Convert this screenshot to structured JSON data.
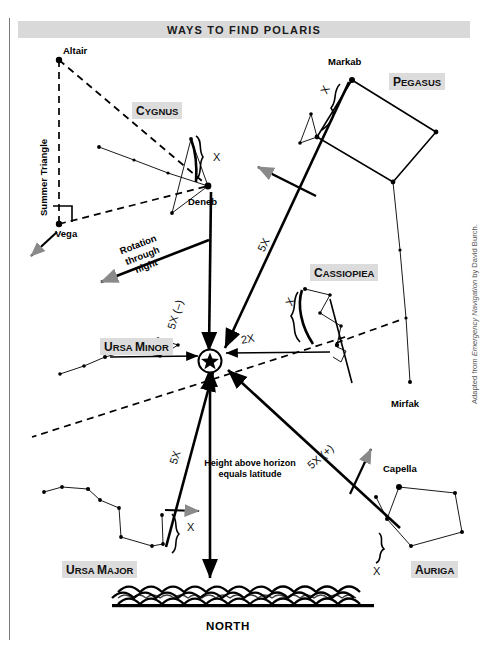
{
  "title": "WAYS TO FIND POLARIS",
  "credit": {
    "prefix": "Adapted from ",
    "work": "Emergency Navigation",
    "suffix": " by David Burch."
  },
  "constellations": [
    {
      "id": "cygnus",
      "cap": "C",
      "rest": "YGNUS"
    },
    {
      "id": "pegasus",
      "cap": "P",
      "rest": "EGASUS"
    },
    {
      "id": "cassiopiea",
      "cap": "C",
      "rest": "ASSIOPIEA"
    },
    {
      "id": "ursa-minor",
      "cap": "U",
      "rest": "RSA ",
      "cap2": "M",
      "rest2": "INOR"
    },
    {
      "id": "ursa-major",
      "cap": "U",
      "rest": "RSA ",
      "cap2": "M",
      "rest2": "AJOR"
    },
    {
      "id": "auriga",
      "cap": "A",
      "rest": "URIGA"
    }
  ],
  "stars": {
    "altair": "Altair",
    "vega": "Vega",
    "deneb": "Deneb",
    "markab": "Markab",
    "mirfak": "Mirfak",
    "capella": "Capella"
  },
  "labels": {
    "summer_triangle": "Summer Triangle",
    "rotation": [
      "Rotation",
      "through",
      "night"
    ],
    "height_note": [
      "Height above horizon",
      "equals latitude"
    ],
    "north": "NORTH"
  },
  "measures": {
    "x_cygnus": "X",
    "x_pegasus": "X",
    "x_cassiopiea": "X",
    "x_ursa_major": "X",
    "x_auriga": "X",
    "five_x_pegasus": "5X",
    "five_x_minus": "5X (–)",
    "five_x_plus": "5X (+)",
    "five_x_ursa_major": "5X",
    "two_x": "2X"
  },
  "colors": {
    "banner": "#d9d9d9",
    "plate": "#dcdcdc",
    "ink": "#000000",
    "gray_arrow": "#8a8a8a",
    "frame": "#7a7a7a"
  }
}
